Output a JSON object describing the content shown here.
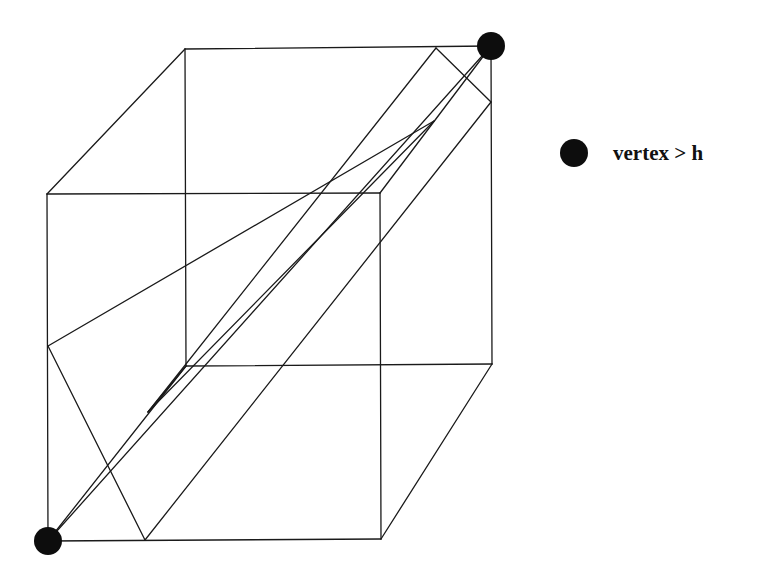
{
  "diagram": {
    "type": "cube-section",
    "stroke_color": "#1a1a1a",
    "vertex_color": "#0d0d0d",
    "cube_vertices": {
      "front_top_left": [
        47,
        194
      ],
      "front_top_right": [
        380,
        193
      ],
      "front_bottom_left": [
        48,
        541
      ],
      "front_bottom_right": [
        381,
        539
      ],
      "back_top_left": [
        185,
        49
      ],
      "back_top_right": [
        491,
        46
      ],
      "back_bottom_left": [
        186,
        366
      ],
      "back_bottom_right": [
        492,
        364
      ]
    },
    "highlighted_vertices": [
      {
        "name": "back_top_right",
        "x": 491,
        "y": 46,
        "r": 14
      },
      {
        "name": "front_bottom_left",
        "x": 48,
        "y": 541,
        "r": 14
      }
    ],
    "section_lines": [
      {
        "from": [
          48,
          346
        ],
        "to": [
          434,
          121
        ]
      },
      {
        "from": [
          48,
          346
        ],
        "to": [
          145,
          540
        ]
      },
      {
        "from": [
          148,
          412
        ],
        "to": [
          436,
          48
        ]
      },
      {
        "from": [
          148,
          412
        ],
        "to": [
          434,
          121
        ]
      },
      {
        "from": [
          148,
          412
        ],
        "to": [
          186,
          366
        ]
      },
      {
        "from": [
          436,
          48
        ],
        "to": [
          491,
          102
        ]
      },
      {
        "from": [
          145,
          540
        ],
        "to": [
          491,
          102
        ]
      },
      {
        "from": [
          48,
          541
        ],
        "to": [
          491,
          46
        ]
      }
    ]
  },
  "legend": {
    "marker": "filled-circle",
    "label": "vertex > h"
  }
}
